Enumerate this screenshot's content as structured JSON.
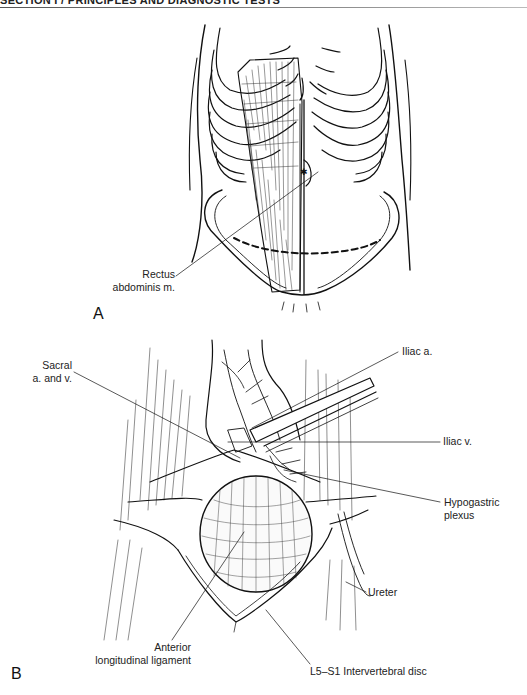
{
  "header": {
    "running_title": "SECTION I / PRINCIPLES AND DIAGNOSTIC TESTS"
  },
  "figure": {
    "panels": [
      {
        "letter": "A",
        "subject": "anterior torso with ribcage, rectus abdominis muscle and dashed Pfannenstiel-type incision line",
        "labels": [
          {
            "id": "rectus",
            "lines": [
              "Rectus",
              "abdominis m."
            ]
          }
        ]
      },
      {
        "letter": "B",
        "subject": "exposure of lumbosacral spine with retracted vessels",
        "labels": [
          {
            "id": "sacral",
            "lines": [
              "Sacral",
              "a. and v."
            ]
          },
          {
            "id": "iliac_a",
            "lines": [
              "Iliac a."
            ]
          },
          {
            "id": "iliac_v",
            "lines": [
              "Iliac v."
            ]
          },
          {
            "id": "hypogastric",
            "lines": [
              "Hypogastric",
              "plexus"
            ]
          },
          {
            "id": "ureter",
            "lines": [
              "Ureter"
            ]
          },
          {
            "id": "anterior_ligament",
            "lines": [
              "Anterior",
              "longitudinal ligament"
            ]
          },
          {
            "id": "disc",
            "lines": [
              "L5–S1 Intervertebral disc"
            ]
          }
        ]
      }
    ]
  }
}
